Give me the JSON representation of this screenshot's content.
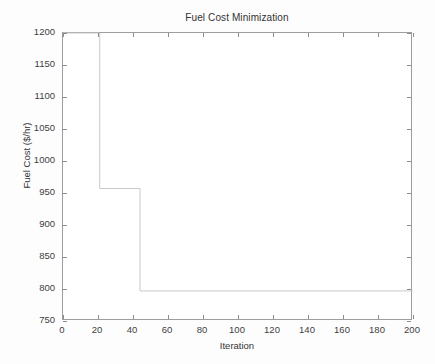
{
  "figure": {
    "background_color": "#fdfdfd",
    "axes_color": "#9d9d9d",
    "line_color": "#c9c9c9"
  },
  "chart_data": {
    "type": "line",
    "title": "Fuel Cost Minimization",
    "xlabel": "Iteration",
    "ylabel": "Fuel Cost ($/hr)",
    "xlim": [
      0,
      200
    ],
    "ylim": [
      750,
      1200
    ],
    "xticks": [
      0,
      20,
      40,
      60,
      80,
      100,
      120,
      140,
      160,
      180,
      200
    ],
    "xtick_labels": [
      "0",
      "20",
      "40",
      "60",
      "80",
      "100",
      "120",
      "140",
      "160",
      "180",
      "200"
    ],
    "yticks": [
      750,
      800,
      850,
      900,
      950,
      1000,
      1050,
      1100,
      1150,
      1200
    ],
    "ytick_labels": [
      "750",
      "800",
      "850",
      "900",
      "950",
      "1000",
      "1050",
      "1100",
      "1150",
      "1200"
    ],
    "grid": false,
    "legend": null,
    "tick_direction": "in",
    "series": [
      {
        "name": "Best fuel cost",
        "style": "step-post",
        "x": [
          0,
          21,
          21,
          44,
          44,
          200
        ],
        "y": [
          1200,
          1200,
          957,
          957,
          797,
          797
        ],
        "steps": [
          {
            "from_iteration": 0,
            "to_iteration": 21,
            "cost": 1200
          },
          {
            "from_iteration": 21,
            "to_iteration": 44,
            "cost": 957
          },
          {
            "from_iteration": 44,
            "to_iteration": 200,
            "cost": 797
          }
        ],
        "final_value": 797
      }
    ]
  }
}
